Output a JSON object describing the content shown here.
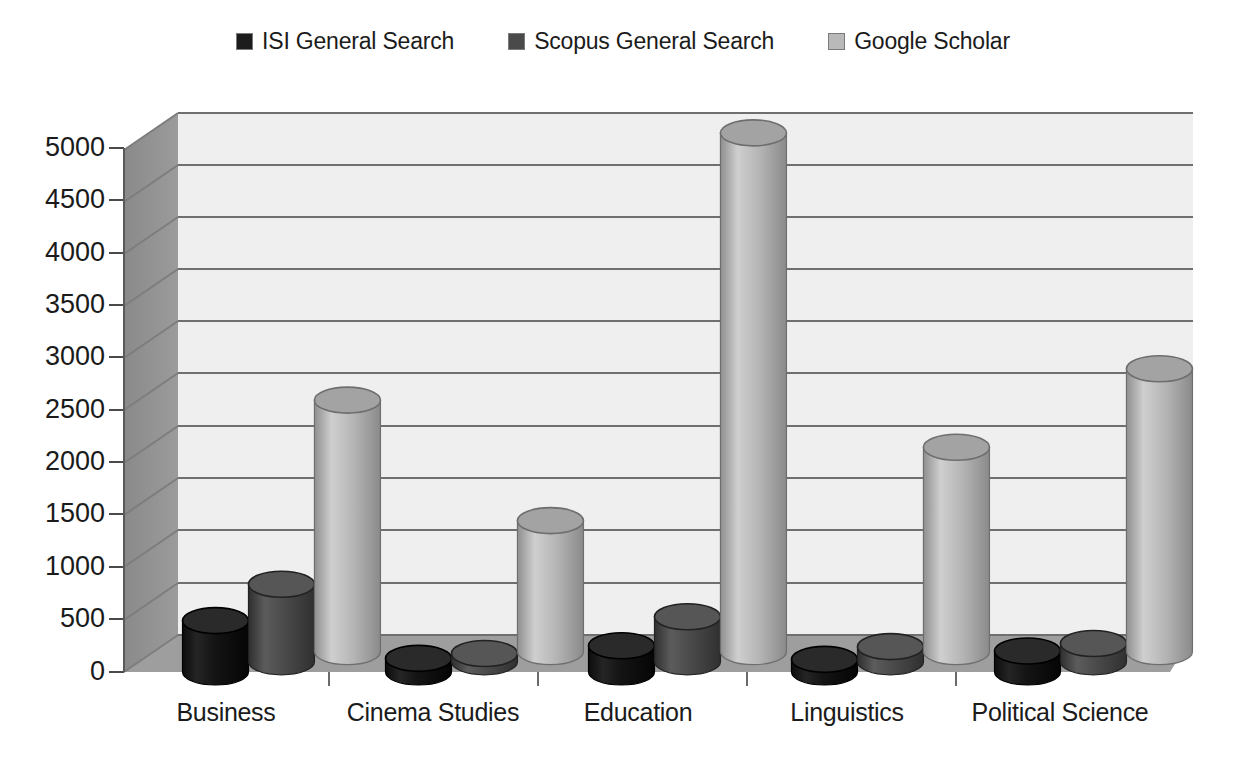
{
  "legend": {
    "entries": [
      {
        "label": "ISI General Search",
        "color": "#1c1c1c"
      },
      {
        "label": "Scopus General Search",
        "color": "#4a4a4a"
      },
      {
        "label": "Google Scholar",
        "color": "#b9b9b9"
      }
    ]
  },
  "axis": {
    "y_ticks": [
      "0",
      "500",
      "1000",
      "1500",
      "2000",
      "2500",
      "3000",
      "3500",
      "4000",
      "4500",
      "5000"
    ],
    "x_ticks": [
      "Business",
      "Cinema Studies",
      "Education",
      "Linguistics",
      "Political Science"
    ]
  },
  "chart_data": {
    "type": "bar",
    "title": "",
    "xlabel": "",
    "ylabel": "",
    "ylim": [
      0,
      5000
    ],
    "ytick_step": 500,
    "grid": true,
    "legend_position": "top",
    "style": "3d-cylinder",
    "categories": [
      "Business",
      "Cinema Studies",
      "Education",
      "Linguistics",
      "Political Science"
    ],
    "series": [
      {
        "name": "ISI General Search",
        "color": "#1c1c1c",
        "values": [
          490,
          130,
          250,
          120,
          200
        ]
      },
      {
        "name": "Scopus General Search",
        "color": "#4a4a4a",
        "values": [
          740,
          80,
          430,
          145,
          175
        ]
      },
      {
        "name": "Google Scholar",
        "color": "#b9b9b9",
        "values": [
          2400,
          1250,
          4950,
          1950,
          2700
        ]
      }
    ]
  },
  "palette": {
    "plot_background": "#eeeeee",
    "wall_shade": "#8c8c8c",
    "floor_shade": "#9a9a9a",
    "gridline": "#6f6f6f",
    "text": "#1b1b1b"
  }
}
